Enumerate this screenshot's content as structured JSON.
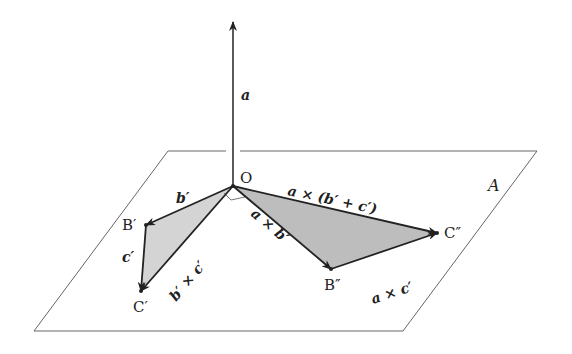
{
  "figure": {
    "plane_label": "A",
    "origin_label": "O",
    "points": {
      "B_prime": "B′",
      "C_prime": "C′",
      "B_double": "B″",
      "C_double": "C″"
    },
    "vectors": {
      "a": "a",
      "b_prime": "b′",
      "c_prime": "c′",
      "b_cross_c": "b′ × c′",
      "a_cross_b": "a × b′",
      "a_cross_c": "a × c′",
      "a_cross_bc": "a × (b′ + c′)"
    },
    "colors": {
      "line": "#222222",
      "plane": "#666666",
      "fill_light": "#d4d4d4",
      "fill_dark": "#bdbdbd"
    }
  }
}
